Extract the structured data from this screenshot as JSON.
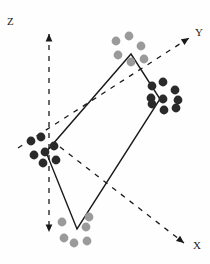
{
  "figure": {
    "type": "3d-axes-diagram",
    "background": "#fefefe",
    "width": 210,
    "height": 264
  },
  "axes": [
    {
      "id": "z",
      "label": "Z",
      "label_pos": [
        9,
        22
      ],
      "style": "dashed",
      "color": "#1a1a1a",
      "x1": 49,
      "y1": 34,
      "x2": 49,
      "y2": 232,
      "arrow_start": true,
      "arrow_end": true,
      "arrow_start_dir": "up",
      "arrow_end_dir": "down"
    },
    {
      "id": "y",
      "label": "Y",
      "label_pos": [
        197,
        33
      ],
      "style": "dashed",
      "color": "#1a1a1a",
      "x1": 18,
      "y1": 148,
      "x2": 189,
      "y2": 38,
      "arrow_start": false,
      "arrow_end": true,
      "arrow_end_dir": "up-right"
    },
    {
      "id": "x",
      "label": "X",
      "label_pos": [
        195,
        246
      ],
      "style": "dashed",
      "color": "#1a1a1a",
      "x1": 60,
      "y1": 147,
      "x2": 184,
      "y2": 243,
      "arrow_start": false,
      "arrow_end": true,
      "arrow_end_dir": "down-right"
    }
  ],
  "quadrilateral": {
    "stroke": "#1a1a1a",
    "stroke_width": 1.4,
    "fill": "none",
    "vertices": [
      {
        "name": "top",
        "x": 131,
        "y": 54
      },
      {
        "name": "right",
        "x": 160,
        "y": 99
      },
      {
        "name": "bottom",
        "x": 77,
        "y": 229
      },
      {
        "name": "left",
        "x": 46,
        "y": 152
      }
    ]
  },
  "clusters": [
    {
      "name": "top-cluster",
      "color": "#9a9a9a",
      "radius": 4.4,
      "points": [
        [
          116,
          41
        ],
        [
          129,
          36
        ],
        [
          141,
          46
        ],
        [
          118,
          55
        ],
        [
          131,
          62
        ],
        [
          144,
          59
        ]
      ]
    },
    {
      "name": "right-cluster",
      "color": "#2a2a2a",
      "radius": 4.4,
      "points": [
        [
          152,
          86
        ],
        [
          163,
          82
        ],
        [
          175,
          90
        ],
        [
          178,
          100
        ],
        [
          151,
          98
        ],
        [
          163,
          99
        ],
        [
          176,
          108
        ],
        [
          164,
          110
        ],
        [
          152,
          104
        ]
      ]
    },
    {
      "name": "left-cluster",
      "color": "#2a2a2a",
      "radius": 4.4,
      "points": [
        [
          31,
          141
        ],
        [
          41,
          137
        ],
        [
          54,
          146
        ],
        [
          34,
          155
        ],
        [
          45,
          152
        ],
        [
          56,
          160
        ],
        [
          43,
          163
        ]
      ]
    },
    {
      "name": "bottom-cluster",
      "color": "#9a9a9a",
      "radius": 4.4,
      "points": [
        [
          62,
          222
        ],
        [
          86,
          227
        ],
        [
          74,
          243
        ],
        [
          64,
          238
        ],
        [
          87,
          241
        ],
        [
          89,
          217
        ]
      ]
    }
  ],
  "chart_data": {
    "type": "scatter",
    "title": "",
    "xlabel": "X",
    "ylabel": "Y",
    "zlabel": "Z",
    "legend": [],
    "series": [
      {
        "name": "top-cluster",
        "marker_color": "#9a9a9a",
        "count": 6
      },
      {
        "name": "right-cluster",
        "marker_color": "#2a2a2a",
        "count": 9
      },
      {
        "name": "left-cluster",
        "marker_color": "#2a2a2a",
        "count": 7
      },
      {
        "name": "bottom-cluster",
        "marker_color": "#9a9a9a",
        "count": 6
      }
    ]
  }
}
